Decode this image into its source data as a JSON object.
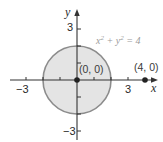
{
  "diagram": {
    "type": "coordinate-plane",
    "origin_px": {
      "x": 77,
      "y": 80
    },
    "unit_px": 17,
    "x_axis": {
      "label": "x",
      "from_px": 10,
      "to_px": 158,
      "ticks": [
        -3,
        -2,
        -1,
        1,
        2,
        3
      ],
      "labeled_ticks": [
        {
          "value": -3,
          "label": "−3"
        },
        {
          "value": 3,
          "label": "3"
        }
      ]
    },
    "y_axis": {
      "label": "y",
      "from_px": 140,
      "to_px": 9,
      "ticks": [
        -3,
        -2,
        -1,
        1,
        2,
        3
      ],
      "labeled_ticks": [
        {
          "value": 3,
          "label": "3"
        },
        {
          "value": -3,
          "label": "−3"
        }
      ]
    },
    "circle": {
      "center": [
        0,
        0
      ],
      "radius": 2,
      "equation": {
        "base_x": "x",
        "exp": "2",
        "plus": " + ",
        "base_y": "y",
        "exp_y": "2",
        "rhs": " = 4"
      },
      "fill": "#e4e4e4",
      "stroke": "#8c8c8c"
    },
    "points": [
      {
        "label": "(0, 0)",
        "x": 0,
        "y": 0
      },
      {
        "label": "(4, 0)",
        "x": 4,
        "y": 0
      }
    ],
    "colors": {
      "axis": "#333333",
      "point": "#222222"
    }
  }
}
